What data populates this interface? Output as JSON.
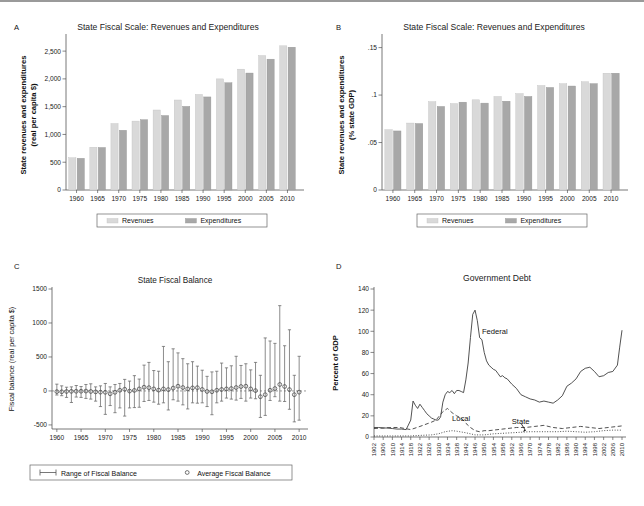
{
  "figure": {
    "panels": [
      "A",
      "B",
      "C",
      "D"
    ]
  },
  "panelA": {
    "letter": "A",
    "title": "State Fiscal Scale: Revenues and Expenditures",
    "legend": {
      "series1": "Revenues",
      "series2": "Expenditures"
    },
    "colors": {
      "revenues": "#d9d9d9",
      "expenditures": "#a8a8a8"
    },
    "chart_data": {
      "type": "bar",
      "title": "State Fiscal Scale: Revenues and Expenditures",
      "xlabel": "",
      "ylabel": "State revenues and expenditures (real per capita $)",
      "categories": [
        "1960",
        "1965",
        "1970",
        "1975",
        "1980",
        "1985",
        "1990",
        "1995",
        "2000",
        "2005",
        "2010"
      ],
      "ytick_labels": [
        "0",
        "500",
        "1,000",
        "1,500",
        "2,000",
        "2,500"
      ],
      "ytick_values": [
        0,
        500,
        1000,
        1500,
        2000,
        2500
      ],
      "ylim": [
        0,
        2700
      ],
      "grid": false,
      "legend_position": "bottom",
      "series": [
        {
          "name": "Revenues",
          "values": [
            580,
            770,
            1195,
            1240,
            1440,
            1620,
            1720,
            2000,
            2175,
            2420,
            2595
          ]
        },
        {
          "name": "Expenditures",
          "values": [
            570,
            765,
            1075,
            1265,
            1340,
            1505,
            1675,
            1930,
            2105,
            2355,
            2570
          ]
        }
      ]
    }
  },
  "panelB": {
    "letter": "B",
    "title": "State Fiscal Scale: Revenues and Expenditures",
    "legend": {
      "series1": "Revenues",
      "series2": "Expenditures"
    },
    "colors": {
      "revenues": "#d9d9d9",
      "expenditures": "#a8a8a8"
    },
    "chart_data": {
      "type": "bar",
      "title": "State Fiscal Scale: Revenues and Expenditures",
      "xlabel": "",
      "ylabel": "State revenues and expenditures (% state GDP)",
      "categories": [
        "1960",
        "1965",
        "1970",
        "1975",
        "1980",
        "1985",
        "1990",
        "1995",
        "2000",
        "2005",
        "2010"
      ],
      "ytick_labels": [
        "0",
        ".05",
        ".1",
        ".15"
      ],
      "ytick_values": [
        0,
        0.05,
        0.1,
        0.15
      ],
      "ylim": [
        0,
        0.158
      ],
      "grid": false,
      "legend_position": "bottom",
      "series": [
        {
          "name": "Revenues",
          "values": [
            0.0635,
            0.0705,
            0.093,
            0.091,
            0.095,
            0.0985,
            0.1015,
            0.11,
            0.112,
            0.114,
            0.123
          ]
        },
        {
          "name": "Expenditures",
          "values": [
            0.0622,
            0.07,
            0.088,
            0.0925,
            0.0915,
            0.0935,
            0.0985,
            0.108,
            0.1095,
            0.112,
            0.123
          ]
        }
      ]
    }
  },
  "panelC": {
    "letter": "C",
    "title": "State Fiscal Balance",
    "legend": {
      "range": "Range of Fiscal Balance",
      "average": "Average Fiscal Balance"
    },
    "chart_data": {
      "type": "scatter",
      "title": "State Fiscal Balance",
      "xlabel": "",
      "ylabel": "Fiscal balance (real per capita $)",
      "ytick_labels": [
        "-500",
        "0",
        "500",
        "1000",
        "1500"
      ],
      "ytick_values": [
        -500,
        0,
        500,
        1000,
        1500
      ],
      "ylim": [
        -560,
        1500
      ],
      "xtick_labels": [
        "1960",
        "1965",
        "1970",
        "1975",
        "1980",
        "1985",
        "1990",
        "1995",
        "2000",
        "2005",
        "2010"
      ],
      "xtick_values": [
        1960,
        1965,
        1970,
        1975,
        1980,
        1985,
        1990,
        1995,
        2000,
        2005,
        2010
      ],
      "xlim": [
        1959,
        2011
      ],
      "grid": false,
      "legend_position": "bottom",
      "points": [
        {
          "year": 1960,
          "avg": -10,
          "low": -60,
          "high": 100
        },
        {
          "year": 1961,
          "avg": -12,
          "low": -70,
          "high": 75
        },
        {
          "year": 1962,
          "avg": -8,
          "low": -95,
          "high": 55
        },
        {
          "year": 1963,
          "avg": -6,
          "low": -170,
          "high": 60
        },
        {
          "year": 1964,
          "avg": -5,
          "low": -90,
          "high": 80
        },
        {
          "year": 1965,
          "avg": -4,
          "low": -95,
          "high": 65
        },
        {
          "year": 1966,
          "avg": -2,
          "low": -110,
          "high": 95
        },
        {
          "year": 1967,
          "avg": -8,
          "low": -120,
          "high": 105
        },
        {
          "year": 1968,
          "avg": -14,
          "low": -150,
          "high": 60
        },
        {
          "year": 1969,
          "avg": -18,
          "low": -230,
          "high": 75
        },
        {
          "year": 1970,
          "avg": -20,
          "low": -345,
          "high": 110
        },
        {
          "year": 1971,
          "avg": -42,
          "low": -215,
          "high": 60
        },
        {
          "year": 1972,
          "avg": -20,
          "low": -320,
          "high": 95
        },
        {
          "year": 1973,
          "avg": 10,
          "low": -250,
          "high": 110
        },
        {
          "year": 1974,
          "avg": 25,
          "low": -370,
          "high": 170
        },
        {
          "year": 1975,
          "avg": -2,
          "low": -250,
          "high": 145
        },
        {
          "year": 1976,
          "avg": 8,
          "low": -245,
          "high": 225
        },
        {
          "year": 1977,
          "avg": 30,
          "low": -240,
          "high": 175
        },
        {
          "year": 1978,
          "avg": 55,
          "low": -155,
          "high": 380
        },
        {
          "year": 1979,
          "avg": 48,
          "low": -140,
          "high": 420
        },
        {
          "year": 1980,
          "avg": 30,
          "low": -165,
          "high": 300
        },
        {
          "year": 1981,
          "avg": 12,
          "low": -195,
          "high": 290
        },
        {
          "year": 1982,
          "avg": 30,
          "low": -175,
          "high": 655
        },
        {
          "year": 1983,
          "avg": 20,
          "low": -280,
          "high": 430
        },
        {
          "year": 1984,
          "avg": 42,
          "low": -130,
          "high": 620
        },
        {
          "year": 1985,
          "avg": 70,
          "low": -150,
          "high": 560
        },
        {
          "year": 1986,
          "avg": 50,
          "low": -205,
          "high": 475
        },
        {
          "year": 1987,
          "avg": 30,
          "low": -265,
          "high": 400
        },
        {
          "year": 1988,
          "avg": 45,
          "low": -175,
          "high": 430
        },
        {
          "year": 1989,
          "avg": 48,
          "low": -180,
          "high": 365
        },
        {
          "year": 1990,
          "avg": 22,
          "low": -175,
          "high": 305
        },
        {
          "year": 1991,
          "avg": -8,
          "low": -230,
          "high": 215
        },
        {
          "year": 1992,
          "avg": -12,
          "low": -350,
          "high": 280
        },
        {
          "year": 1993,
          "avg": 10,
          "low": -175,
          "high": 290
        },
        {
          "year": 1994,
          "avg": 22,
          "low": -150,
          "high": 410
        },
        {
          "year": 1995,
          "avg": 30,
          "low": -105,
          "high": 340
        },
        {
          "year": 1996,
          "avg": 35,
          "low": -120,
          "high": 370
        },
        {
          "year": 1997,
          "avg": 50,
          "low": -135,
          "high": 510
        },
        {
          "year": 1998,
          "avg": 65,
          "low": -110,
          "high": 375
        },
        {
          "year": 1999,
          "avg": 70,
          "low": -150,
          "high": 400
        },
        {
          "year": 2000,
          "avg": 30,
          "low": -105,
          "high": 310
        },
        {
          "year": 2001,
          "avg": 5,
          "low": -115,
          "high": 420
        },
        {
          "year": 2002,
          "avg": -85,
          "low": -390,
          "high": 230
        },
        {
          "year": 2003,
          "avg": -55,
          "low": -360,
          "high": 780
        },
        {
          "year": 2004,
          "avg": 10,
          "low": -140,
          "high": 735
        },
        {
          "year": 2005,
          "avg": 35,
          "low": -85,
          "high": 700
        },
        {
          "year": 2006,
          "avg": 95,
          "low": -150,
          "high": 1255
        },
        {
          "year": 2007,
          "avg": 65,
          "low": -155,
          "high": 665
        },
        {
          "year": 2008,
          "avg": 20,
          "low": -270,
          "high": 900
        },
        {
          "year": 2009,
          "avg": -55,
          "low": -455,
          "high": 230
        },
        {
          "year": 2010,
          "avg": -18,
          "low": -430,
          "high": 510
        }
      ]
    }
  },
  "panelD": {
    "letter": "D",
    "title": "Government Debt",
    "annotations": {
      "federal": "Federal",
      "local": "Local",
      "state": "State"
    },
    "chart_data": {
      "type": "line",
      "title": "Government Debt",
      "xlabel": "",
      "ylabel": "Percent of GDP",
      "ytick_labels": [
        "0",
        "20",
        "40",
        "60",
        "80",
        "100",
        "120",
        "140"
      ],
      "ytick_values": [
        0,
        20,
        40,
        60,
        80,
        100,
        120,
        140
      ],
      "ylim": [
        0,
        140
      ],
      "xtick_labels": [
        "1902",
        "1906",
        "1910",
        "1914",
        "1918",
        "1922",
        "1926",
        "1930",
        "1934",
        "1938",
        "1942",
        "1946",
        "1950",
        "1954",
        "1958",
        "1962",
        "1966",
        "1970",
        "1974",
        "1978",
        "1982",
        "1986",
        "1990",
        "1994",
        "1998",
        "2002",
        "2006",
        "2010"
      ],
      "xlim": [
        1902,
        2010
      ],
      "grid": false,
      "legend_position": "inline-annotations",
      "series": [
        {
          "name": "Federal",
          "style": "solid",
          "x": [
            1902,
            1904,
            1906,
            1908,
            1910,
            1912,
            1914,
            1916,
            1918,
            1919,
            1920,
            1921,
            1922,
            1923,
            1924,
            1925,
            1926,
            1927,
            1928,
            1929,
            1930,
            1931,
            1932,
            1933,
            1934,
            1935,
            1936,
            1937,
            1938,
            1939,
            1940,
            1941,
            1942,
            1943,
            1944,
            1945,
            1946,
            1947,
            1948,
            1949,
            1950,
            1951,
            1952,
            1953,
            1954,
            1955,
            1956,
            1957,
            1958,
            1959,
            1960,
            1962,
            1964,
            1966,
            1968,
            1970,
            1972,
            1974,
            1976,
            1978,
            1980,
            1982,
            1984,
            1986,
            1988,
            1990,
            1992,
            1994,
            1996,
            1998,
            2000,
            2002,
            2004,
            2006,
            2008,
            2009,
            2010
          ],
          "y": [
            9,
            9,
            8.5,
            8.5,
            8,
            7.5,
            7.5,
            7,
            16,
            34,
            30,
            27,
            31,
            28,
            25,
            22,
            20,
            18,
            17,
            16,
            16,
            19,
            33,
            40,
            43,
            42,
            44,
            41,
            44,
            44,
            43,
            42,
            54,
            70,
            94,
            116,
            120,
            110,
            94,
            92,
            80,
            72,
            68,
            66,
            64,
            63,
            60,
            57,
            58,
            56,
            55,
            50,
            46,
            40,
            38,
            36,
            35,
            33,
            34,
            33,
            32,
            35,
            39,
            48,
            51,
            55,
            62,
            65,
            66,
            62,
            57,
            58,
            61,
            62,
            68,
            85,
            101
          ]
        },
        {
          "name": "Local",
          "style": "dashed",
          "x": [
            1902,
            1906,
            1910,
            1913,
            1918,
            1922,
            1927,
            1929,
            1932,
            1934,
            1936,
            1938,
            1940,
            1942,
            1944,
            1946,
            1948,
            1950,
            1952,
            1956,
            1960,
            1964,
            1968,
            1972,
            1976,
            1980,
            1984,
            1988,
            1992,
            1996,
            2000,
            2004,
            2008,
            2010
          ],
          "y": [
            8,
            8.5,
            9,
            9,
            7,
            10,
            14,
            16,
            24,
            27,
            23,
            20,
            18,
            13,
            9,
            6,
            5,
            6,
            6,
            7,
            8,
            9,
            9,
            10,
            11,
            9,
            8,
            9,
            10,
            9,
            8,
            9,
            10,
            10.5
          ]
        },
        {
          "name": "State",
          "style": "dotted",
          "x": [
            1902,
            1910,
            1918,
            1922,
            1927,
            1930,
            1933,
            1936,
            1938,
            1942,
            1946,
            1950,
            1954,
            1958,
            1962,
            1966,
            1970,
            1974,
            1978,
            1982,
            1986,
            1990,
            1994,
            1998,
            2002,
            2006,
            2010
          ],
          "y": [
            1,
            1,
            1,
            1.5,
            2,
            3,
            5,
            6,
            5.5,
            4,
            2,
            2,
            3,
            3.5,
            4,
            4.5,
            5,
            5,
            5,
            5,
            5.5,
            5,
            4.5,
            5,
            6,
            6.5,
            6.5
          ]
        }
      ]
    }
  }
}
